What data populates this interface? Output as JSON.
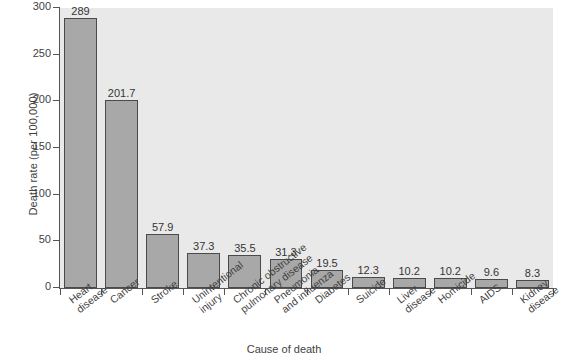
{
  "chart_data": {
    "type": "bar",
    "title": "",
    "xlabel": "Cause of death",
    "ylabel": "Death rate (per 100,000)",
    "ylim": [
      0,
      300
    ],
    "yticks": [
      0,
      50,
      100,
      150,
      200,
      250,
      300
    ],
    "grid": false,
    "legend": null,
    "bar_color": "#a8a8a8",
    "bar_edge_color": "#4a4a4a",
    "plot_background": "#e9e9e9",
    "figure_background": "#ffffff",
    "categories": [
      "Heart disease",
      "Cancer",
      "Stroke",
      "Unintentional injury",
      "Chronic obstructive pulmonary disease",
      "Pneumonia and influenza",
      "Diabetes",
      "Suicide",
      "Liver disease",
      "Homicide",
      "AIDS",
      "Kidney disease"
    ],
    "category_lines": [
      [
        "Heart",
        "disease"
      ],
      [
        "Cancer"
      ],
      [
        "Stroke"
      ],
      [
        "Unintentional",
        "injury"
      ],
      [
        "Chronic obstructive",
        "pulmonary disease"
      ],
      [
        "Pneumonia",
        "and influenza"
      ],
      [
        "Diabetes"
      ],
      [
        "Suicide"
      ],
      [
        "Liver",
        "disease"
      ],
      [
        "Homicide"
      ],
      [
        "AIDS"
      ],
      [
        "Kidney",
        "disease"
      ]
    ],
    "values": [
      289,
      201.7,
      57.9,
      37.3,
      35.5,
      31.3,
      19.5,
      12.3,
      10.2,
      10.2,
      9.6,
      8.3
    ],
    "value_labels": [
      "289",
      "201.7",
      "57.9",
      "37.3",
      "35.5",
      "31.3",
      "19.5",
      "12.3",
      "10.2",
      "10.2",
      "9.6",
      "8.3"
    ],
    "ytick_labels": [
      "0",
      "50",
      "100",
      "150",
      "200",
      "250",
      "300"
    ]
  }
}
